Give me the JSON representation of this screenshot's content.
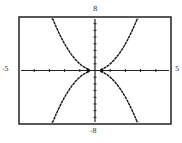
{
  "chart_data": {
    "type": "line",
    "title": "",
    "xlabel": "",
    "ylabel": "",
    "xlim": [
      -5,
      5
    ],
    "ylim": [
      -8,
      8
    ],
    "x_ticks_step": 1,
    "y_ticks_step": 1,
    "grid": false,
    "legend": "none",
    "tick_labels": {
      "xmin": "-5",
      "xmax": "5",
      "ymin": "-8",
      "ymax": "8"
    },
    "series": [
      {
        "name": "upper curve",
        "equation": "y = x^2 (approx)",
        "x": [
          -2.8,
          -2,
          -1,
          -0.4,
          0.4,
          1,
          2,
          2.8
        ],
        "y": [
          7.8,
          4,
          1,
          0.16,
          0.16,
          1,
          4,
          7.8
        ]
      },
      {
        "name": "lower curve",
        "equation": "y = -x^2 (approx)",
        "x": [
          -2.8,
          -2,
          -1,
          -0.4,
          0.4,
          1,
          2,
          2.8
        ],
        "y": [
          -7.8,
          -4,
          -1,
          -0.16,
          -0.16,
          -1,
          -4,
          -7.8
        ]
      }
    ],
    "colors": {
      "frame": "#222222",
      "curve": "#111111",
      "axis": "#222222"
    }
  }
}
